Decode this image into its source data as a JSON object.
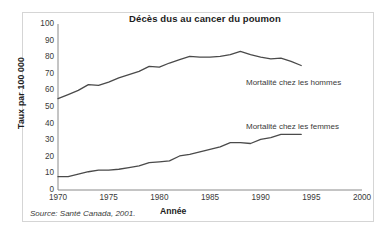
{
  "chart_data": {
    "type": "line",
    "title": "Décès dus au cancer du poumon",
    "xlabel": "Année",
    "ylabel": "Taux par 100 000",
    "xlim": [
      1970,
      2000
    ],
    "ylim": [
      0,
      100
    ],
    "xticks": [
      1970,
      1975,
      1980,
      1985,
      1990,
      1995,
      2000
    ],
    "yticks": [
      0,
      10,
      20,
      30,
      40,
      50,
      60,
      70,
      80,
      90,
      100
    ],
    "grid": false,
    "legend_position": "inline-right",
    "source": "Source: Santé Canada, 2001.",
    "x": [
      1970,
      1971,
      1972,
      1973,
      1974,
      1975,
      1976,
      1977,
      1978,
      1979,
      1980,
      1981,
      1982,
      1983,
      1984,
      1985,
      1986,
      1987,
      1988,
      1989,
      1990,
      1991,
      1992,
      1993,
      1994
    ],
    "series": [
      {
        "name": "Mortalité chez les hommes",
        "label": "Mortalité chez les hommes",
        "color": "#4a4a4a",
        "values": [
          55,
          57.5,
          60,
          63.5,
          63,
          65,
          67.5,
          69.5,
          71.5,
          74.5,
          74,
          76.5,
          78.5,
          80.5,
          80,
          80,
          80.5,
          81.5,
          83.5,
          81.5,
          80,
          79,
          79.5,
          77.5,
          75
        ]
      },
      {
        "name": "Mortalité chez les femmes",
        "label": "Mortalité chez les femmes",
        "color": "#4a4a4a",
        "values": [
          8,
          8,
          9.5,
          11,
          12,
          12,
          12.5,
          13.5,
          14.5,
          16.5,
          17,
          17.5,
          20.5,
          21.5,
          23,
          24.5,
          26,
          28.5,
          28.5,
          28,
          30.5,
          31.5,
          33.5,
          33.5,
          33.5
        ]
      }
    ]
  }
}
